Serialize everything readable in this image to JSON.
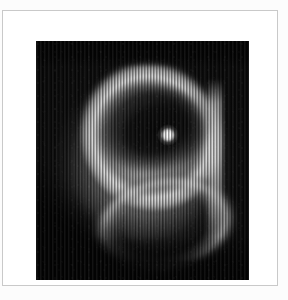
{
  "page": {
    "background_color": "#fbfbfb",
    "type": "figure-plate"
  },
  "card": {
    "name": "figure-card",
    "background_color": "#ffffff",
    "border_color": "#c9c9c9"
  },
  "figure": {
    "alt_text": "Grayscale astronomical image of a planetary nebula with a bright central star, an elliptical dark inner cavity and a luminous outer rim, rendered with vertical scanline striping artifacts",
    "background_color": "#050505",
    "highlight_color": "#ffffff",
    "midtone_color": "#b0b0b0",
    "shadow_color": "#080808"
  },
  "chart_data": {
    "type": "heatmap",
    "title": "",
    "subtitle": "",
    "xlabel": "",
    "ylabel": "",
    "colormap": "grayscale",
    "grid": false,
    "legend": "none",
    "plate_pixels": {
      "width": 213,
      "height": 239
    },
    "features": [
      {
        "name": "central-star",
        "center": [
          121,
          94
        ],
        "radius": 8,
        "peak_intensity": 255,
        "description": "unresolved bright white point source"
      },
      {
        "name": "inner-cavity",
        "center": [
          120,
          89
        ],
        "semi_axes": [
          58,
          43
        ],
        "rotation_deg": -16,
        "mean_intensity": 14,
        "description": "dark elliptical hole surrounding the star"
      },
      {
        "name": "bright-rim",
        "center": [
          115,
          96
        ],
        "semi_axes": [
          75,
          80
        ],
        "rotation_deg": -22,
        "peak_intensity": 225,
        "description": "luminous elliptical torus / outer ring"
      },
      {
        "name": "outer-halo-lobe",
        "center": [
          107,
          125
        ],
        "semi_axes": [
          93,
          103
        ],
        "rotation_deg": -8,
        "mean_intensity": 150,
        "description": "extended lower-left lobe of diffuse emission"
      },
      {
        "name": "right-flank-edge",
        "center": [
          179,
          123
        ],
        "peak_intensity": 225,
        "description": "bright near-vertical boundary on right side"
      },
      {
        "name": "lower-right-arc",
        "center": [
          128,
          184
        ],
        "peak_intensity": 205,
        "description": "bright arc along the bottom-right boundary"
      }
    ],
    "artifact": {
      "type": "vertical-striping",
      "period_px": 3,
      "amplitude": 0.5,
      "orientation": "vertical",
      "description": "periodic vertical scanline/readout artifact across the frame"
    },
    "intensity_range": [
      3,
      255
    ]
  }
}
